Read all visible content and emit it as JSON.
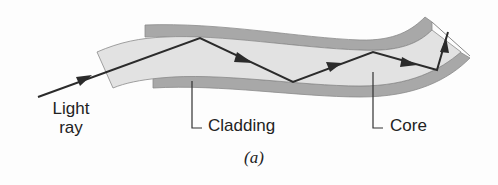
{
  "figure": {
    "caption": "(a)",
    "labels": {
      "light_ray_line1": "Light",
      "light_ray_line2": "ray",
      "cladding": "Cladding",
      "core": "Core"
    },
    "colors": {
      "cladding": "#a8a8a8",
      "core": "#e2e2e2",
      "ray": "#2b2b2b",
      "text": "#222222",
      "leader": "#333333"
    },
    "ray_path": [
      [
        38,
        97
      ],
      [
        200,
        38
      ],
      [
        293,
        82
      ],
      [
        373,
        52
      ],
      [
        437,
        70
      ],
      [
        448,
        32
      ]
    ]
  }
}
